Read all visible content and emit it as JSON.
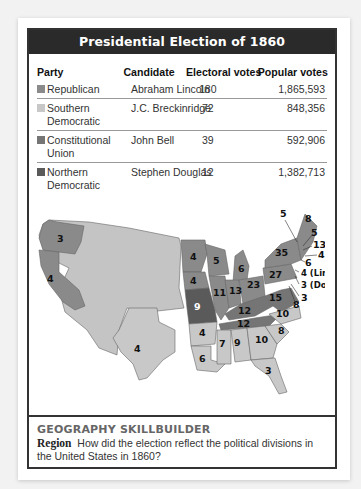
{
  "title": "Presidential Election of 1860",
  "table": {
    "headers": {
      "party": "Party",
      "candidate": "Candidate",
      "electoral": "Electoral votes",
      "popular": "Popular votes"
    },
    "rows": [
      {
        "party_line1": "Republican",
        "party_line2": "",
        "candidate": "Abraham Lincoln",
        "electoral": "180",
        "popular": "1,865,593",
        "color": "#8a8a8a"
      },
      {
        "party_line1": "Southern",
        "party_line2": "Democratic",
        "candidate": "J.C. Breckinridge",
        "electoral": "72",
        "popular": "848,356",
        "color": "#c8c8c8"
      },
      {
        "party_line1": "Constitutional",
        "party_line2": "Union",
        "candidate": "John Bell",
        "electoral": "39",
        "popular": "592,906",
        "color": "#757575"
      },
      {
        "party_line1": "Northern",
        "party_line2": "Democratic",
        "candidate": "Stephen Douglas",
        "electoral": "12",
        "popular": "1,382,713",
        "color": "#5a5a5a"
      }
    ]
  },
  "map": {
    "labels": {
      "oregon": "3",
      "california": "4",
      "minnesota": "4",
      "iowa": "4",
      "wisconsin": "5",
      "michigan": "6",
      "illinois": "11",
      "indiana": "13",
      "ohio": "23",
      "pennsylvania": "27",
      "new_york": "35",
      "missouri": "9",
      "kentucky": "12",
      "tennessee": "12",
      "virginia": "15",
      "north_carolina": "10",
      "south_carolina": "8",
      "georgia": "10",
      "alabama": "9",
      "mississippi": "7",
      "louisiana": "6",
      "arkansas": "4",
      "texas": "4",
      "florida": "3",
      "maine": "8",
      "vermont": "5",
      "new_hampshire": "5",
      "massachusetts": "13",
      "rhode_island": "4",
      "connecticut": "6",
      "new_jersey_lincoln": "4 (Lincoln)",
      "new_jersey_douglas": "3 (Douglas)",
      "delaware": "3",
      "maryland": "8"
    }
  },
  "skillbuilder": {
    "heading": "GEOGRAPHY SKILLBUILDER",
    "label": "Region",
    "question": "How did the election reflect the political divisions in the United States in 1860?"
  }
}
